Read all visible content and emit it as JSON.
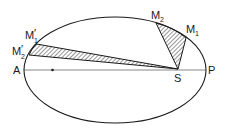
{
  "diagram": {
    "ellipse": {
      "cx": 115,
      "cy": 70,
      "rx": 91,
      "ry": 53
    },
    "axis": {
      "x1": 24,
      "x2": 206,
      "y": 70
    },
    "focus_empty": {
      "x": 52.5,
      "y": 70
    },
    "sun": {
      "x": 178,
      "y": 69
    },
    "labels": {
      "A": "A",
      "P": "P",
      "S": "S",
      "M1": "M",
      "M1_sub": "1",
      "M2": "M",
      "M2_sub": "2",
      "M1p": "M",
      "M1p_sub": "1",
      "M1p_prime": "′",
      "M2p": "M",
      "M2p_sub": "2",
      "M2p_prime": "′"
    },
    "sectors": [
      {
        "name": "perihelion-sector",
        "from": "M1",
        "to": "M2",
        "hatched": true
      },
      {
        "name": "aphelion-sector",
        "from": "M1'",
        "to": "M2'",
        "hatched": true
      }
    ],
    "colors": {
      "stroke": "#1a1a1a",
      "background": "#ffffff"
    }
  }
}
